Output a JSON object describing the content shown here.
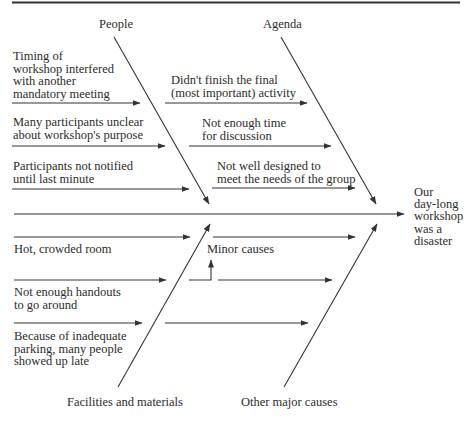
{
  "diagram": {
    "type": "fishbone (cause-and-effect) diagram",
    "effect": "Our\nday-long\nworkshop\nwas a\ndisaster",
    "categories": {
      "people": {
        "label": "People",
        "causes": [
          "Timing of\nworkshop interfered\nwith another\nmandatory meeting",
          "Many participants unclear\nabout workshop's purpose",
          "Participants not notified\nuntil last minute"
        ]
      },
      "agenda": {
        "label": "Agenda",
        "causes": [
          "Didn't finish the final\n(most important) activity",
          "Not enough time\nfor discussion",
          "Not well designed to\nmeet the needs of the group"
        ]
      },
      "facilities": {
        "label": "Facilities and materials",
        "causes": [
          "Hot, crowded room",
          "Not enough handouts\nto go around",
          "Because of inadequate\nparking, many people\nshowed up late"
        ]
      },
      "other": {
        "label": "Other major causes",
        "annotation": "Minor causes"
      }
    },
    "colors": {
      "line": "#333333",
      "text": "#2b2b2b",
      "background": "#ffffff"
    }
  }
}
